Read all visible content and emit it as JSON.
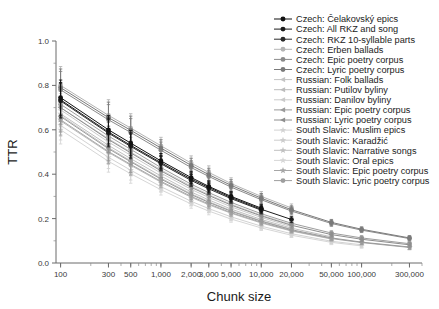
{
  "chart_data": {
    "type": "line",
    "title": "",
    "xlabel": "Chunk size",
    "ylabel": "TTR",
    "xscale": "log",
    "xlim": [
      90,
      400000
    ],
    "ylim": [
      0.0,
      1.0
    ],
    "grid": false,
    "legend_position": "top-right",
    "yticks": [
      "0.0",
      "0.2",
      "0.4",
      "0.6",
      "0.8",
      "1.0"
    ],
    "ytick_values": [
      0.0,
      0.2,
      0.4,
      0.6,
      0.8,
      1.0
    ],
    "xticks": [
      "100",
      "300",
      "500",
      "1,000",
      "2,000",
      "3,000",
      "5,000",
      "10,000",
      "20,000",
      "50,000",
      "100,000",
      "300,000"
    ],
    "xtick_values": [
      100,
      300,
      500,
      1000,
      2000,
      3000,
      5000,
      10000,
      20000,
      50000,
      100000,
      300000
    ],
    "x": [
      100,
      300,
      500,
      1000,
      2000,
      3000,
      5000,
      10000,
      20000,
      50000,
      100000,
      300000
    ],
    "series": [
      {
        "name": "Czech: Čelakovský epics",
        "marker": "circle",
        "color": "#111111",
        "values": [
          0.745,
          0.6,
          0.54,
          0.46,
          0.385,
          0.345,
          0.3,
          0.247,
          null,
          null,
          null,
          null
        ]
      },
      {
        "name": "Czech: All RKZ and song",
        "marker": "circle",
        "color": "#1c1c1c",
        "values": [
          0.735,
          0.59,
          0.53,
          0.452,
          0.378,
          0.34,
          0.295,
          0.242,
          0.196,
          null,
          null,
          null
        ]
      },
      {
        "name": "Czech: RKZ 10-syllable parts",
        "marker": "circle",
        "color": "#2a2a2a",
        "values": [
          0.73,
          0.585,
          0.525,
          0.447,
          0.372,
          0.334,
          0.29,
          0.238,
          null,
          null,
          null,
          null
        ]
      },
      {
        "name": "Czech: Erben ballads",
        "marker": "circle",
        "color": "#b4b4b4",
        "values": [
          0.8,
          0.665,
          0.608,
          0.528,
          0.45,
          0.408,
          0.358,
          0.3,
          0.248,
          null,
          null,
          null
        ]
      },
      {
        "name": "Czech: Epic poetry corpus",
        "marker": "circle",
        "color": "#8a8a8a",
        "values": [
          0.78,
          0.645,
          0.588,
          0.508,
          0.43,
          0.39,
          0.342,
          0.285,
          0.234,
          0.178,
          0.148,
          0.11
        ]
      },
      {
        "name": "Czech: Lyric poetry corpus",
        "marker": "circle",
        "color": "#7a7a7a",
        "values": [
          0.79,
          0.655,
          0.598,
          0.518,
          0.44,
          0.398,
          0.35,
          0.292,
          0.24,
          0.183,
          0.152,
          0.113
        ]
      },
      {
        "name": "Russian: Folk ballads",
        "marker": "triangle-left",
        "color": "#c4c4c4",
        "values": [
          0.665,
          0.52,
          0.46,
          0.382,
          0.312,
          0.276,
          0.236,
          0.19,
          0.152,
          null,
          null,
          null
        ]
      },
      {
        "name": "Russian: Putilov byliny",
        "marker": "triangle-left",
        "color": "#bcbcbc",
        "values": [
          0.64,
          0.498,
          0.44,
          0.364,
          0.296,
          0.262,
          0.224,
          0.18,
          0.144,
          0.108,
          null,
          null
        ]
      },
      {
        "name": "Russian: Danilov byliny",
        "marker": "triangle-left",
        "color": "#cacaca",
        "values": [
          0.69,
          0.545,
          0.485,
          0.405,
          0.332,
          0.295,
          0.253,
          0.205,
          0.164,
          null,
          null,
          null
        ]
      },
      {
        "name": "Russian: Epic poetry corpus",
        "marker": "triangle-left",
        "color": "#9a9a9a",
        "values": [
          0.66,
          0.515,
          0.456,
          0.378,
          0.308,
          0.273,
          0.233,
          0.188,
          0.15,
          0.113,
          0.094,
          0.072
        ]
      },
      {
        "name": "Russian: Lyric poetry corpus",
        "marker": "triangle-left",
        "color": "#8e8e8e",
        "values": [
          0.7,
          0.556,
          0.496,
          0.415,
          0.341,
          0.304,
          0.261,
          0.212,
          0.17,
          0.128,
          0.107,
          0.082
        ]
      },
      {
        "name": "South Slavic: Muslim epics",
        "marker": "star",
        "color": "#d2d2d2",
        "values": [
          0.62,
          0.476,
          0.418,
          0.344,
          0.278,
          0.245,
          0.208,
          0.166,
          0.132,
          0.098,
          0.082,
          null
        ]
      },
      {
        "name": "South Slavic: Karadžić",
        "marker": "star",
        "color": "#cccccc",
        "values": [
          0.7,
          0.56,
          0.5,
          0.42,
          0.346,
          0.308,
          0.265,
          0.215,
          0.173,
          null,
          null,
          null
        ]
      },
      {
        "name": "South Slavic: Narrative songs",
        "marker": "star",
        "color": "#c0c0c0",
        "values": [
          0.672,
          0.53,
          0.47,
          0.392,
          0.32,
          0.284,
          0.243,
          0.196,
          0.157,
          0.118,
          null,
          null
        ]
      },
      {
        "name": "South Slavic: Oral epics",
        "marker": "star",
        "color": "#d6d6d6",
        "values": [
          0.6,
          0.458,
          0.402,
          0.33,
          0.266,
          0.234,
          0.198,
          0.158,
          0.125,
          0.093,
          0.077,
          null
        ]
      },
      {
        "name": "South Slavic: Epic poetry corpus",
        "marker": "star",
        "color": "#a6a6a6",
        "values": [
          0.645,
          0.502,
          0.444,
          0.368,
          0.3,
          0.266,
          0.227,
          0.183,
          0.146,
          0.11,
          0.092,
          0.07
        ]
      },
      {
        "name": "South Slavic: Lyric poetry corpus",
        "marker": "circle",
        "color": "#9e9e9e",
        "values": [
          0.715,
          0.572,
          0.512,
          0.43,
          0.355,
          0.317,
          0.273,
          0.222,
          0.179,
          0.135,
          0.113,
          0.087
        ]
      }
    ]
  },
  "legend": {
    "items": [
      "Czech: Čelakovský epics",
      "Czech: All RKZ and song",
      "Czech: RKZ 10-syllable parts",
      "Czech: Erben ballads",
      "Czech: Epic poetry corpus",
      "Czech: Lyric poetry corpus",
      "Russian: Folk ballads",
      "Russian: Putilov byliny",
      "Russian: Danilov byliny",
      "Russian: Epic poetry corpus",
      "Russian: Lyric poetry corpus",
      "South Slavic: Muslim epics",
      "South Slavic: Karadžić",
      "South Slavic: Narrative songs",
      "South Slavic: Oral epics",
      "South Slavic: Epic poetry corpus",
      "South Slavic: Lyric poetry corpus"
    ]
  }
}
